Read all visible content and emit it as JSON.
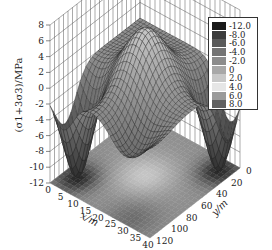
{
  "chart_data": {
    "type": "surface3d",
    "title": "",
    "zlabel": "(σ1+3σ3)/MPa",
    "xlabel": "x/m",
    "ylabel": "y/m",
    "z_ticks": [
      "8",
      "6",
      "4",
      "2",
      "0",
      "-2",
      "-4",
      "-6",
      "-8",
      "-10",
      "-12"
    ],
    "x_ticks": [
      "0",
      "5",
      "10",
      "15",
      "20",
      "25",
      "30",
      "35",
      "40"
    ],
    "y_ticks": [
      "0",
      "20",
      "40",
      "60",
      "80",
      "100",
      "120"
    ],
    "zlim": [
      -12,
      8
    ],
    "xlim": [
      0,
      40
    ],
    "ylim": [
      0,
      120
    ],
    "grid": true,
    "projected_contour_on_floor": true,
    "legend": {
      "position": "top-right",
      "entries": [
        {
          "label": "-12.0",
          "color": "#1a1a1a"
        },
        {
          "label": "-8.0",
          "color": "#3c3c3c"
        },
        {
          "label": "-6.0",
          "color": "#5a5a5a"
        },
        {
          "label": "-4.0",
          "color": "#747474"
        },
        {
          "label": "-2.0",
          "color": "#8c8c8c"
        },
        {
          "label": "0",
          "color": "#a8a8a8"
        },
        {
          "label": "2.0",
          "color": "#c8c8c8"
        },
        {
          "label": "4.0",
          "color": "#e6e6e6"
        },
        {
          "label": "6.0",
          "color": "#9a9a9a"
        },
        {
          "label": "8.0",
          "color": "#606060"
        }
      ]
    }
  }
}
